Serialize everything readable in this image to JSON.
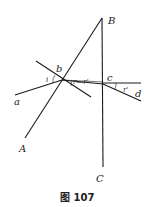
{
  "figure": {
    "caption": "图 107",
    "labels": {
      "B": "B",
      "A": "A",
      "C": "C",
      "a": "a",
      "b": "b",
      "c": "c",
      "d": "d",
      "i": "i",
      "r_rprime": "r—r'",
      "rprime": "r'"
    }
  }
}
